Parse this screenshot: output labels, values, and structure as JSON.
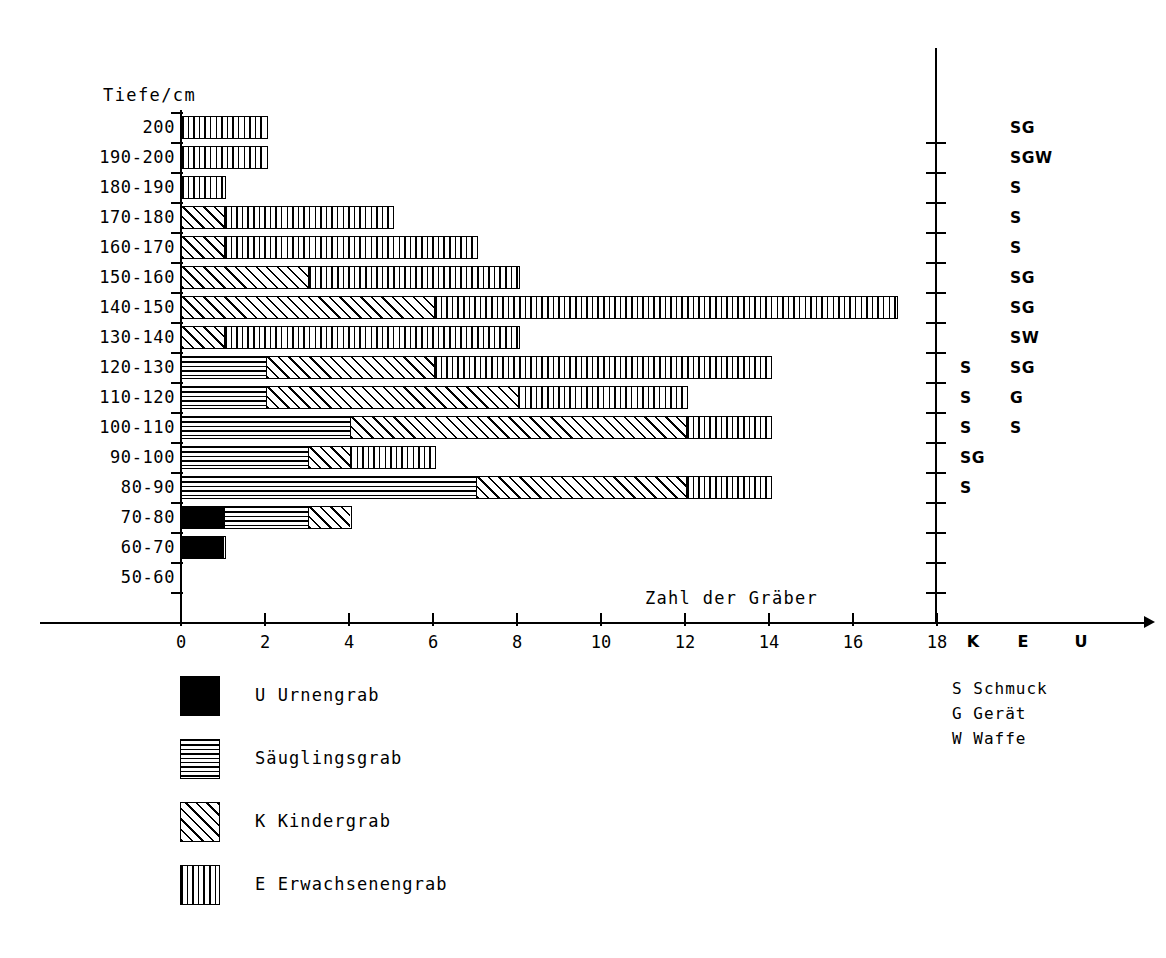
{
  "axes": {
    "y_title": "Tiefe/cm",
    "x_title": "Zahl der Gräber",
    "x_ticks": [
      "0",
      "2",
      "4",
      "6",
      "8",
      "10",
      "12",
      "14",
      "16",
      "18"
    ],
    "column_headers": [
      "K",
      "E",
      "U"
    ]
  },
  "goods_key": [
    "S Schmuck",
    "G Gerät",
    "W Waffe"
  ],
  "legend": [
    {
      "pattern": "solid-black",
      "pattern_name": "p-urne",
      "label": "U Urnengrab"
    },
    {
      "pattern": "horizontal-lines",
      "pattern_name": "p-saeugling",
      "label": "Säuglingsgrab"
    },
    {
      "pattern": "diagonal-hatch",
      "pattern_name": "p-kind",
      "label": "K Kindergrab"
    },
    {
      "pattern": "vertical-lines",
      "pattern_name": "p-erwachsen",
      "label": "E Erwachsenengrab"
    }
  ],
  "chart_data": {
    "type": "bar",
    "orientation": "horizontal",
    "stacked": true,
    "title": "",
    "xlabel": "Zahl der Gräber",
    "ylabel": "Tiefe/cm",
    "xlim": [
      0,
      18
    ],
    "xticks": [
      0,
      2,
      4,
      6,
      8,
      10,
      12,
      14,
      16,
      18
    ],
    "grid": false,
    "legend_position": "bottom-left",
    "categories": [
      "200",
      "190-200",
      "180-190",
      "170-180",
      "160-170",
      "150-160",
      "140-150",
      "130-140",
      "120-130",
      "110-120",
      "100-110",
      "90-100",
      "80-90",
      "70-80",
      "60-70",
      "50-60"
    ],
    "series": [
      {
        "name": "U Urnengrab",
        "key": "U",
        "values": [
          0,
          0,
          0,
          0,
          0,
          0,
          0,
          0,
          0,
          0,
          0,
          0,
          0,
          1,
          1,
          0
        ]
      },
      {
        "name": "Säuglingsgrab",
        "key": "S",
        "values": [
          0,
          0,
          0,
          0,
          0,
          0,
          0,
          0,
          2,
          2,
          4,
          3,
          7,
          2,
          0,
          0
        ]
      },
      {
        "name": "K Kindergrab",
        "key": "K",
        "values": [
          0,
          0,
          0,
          1,
          1,
          3,
          6,
          1,
          4,
          6,
          8,
          1,
          5,
          1,
          0,
          0
        ]
      },
      {
        "name": "E Erwachsenengrab",
        "key": "E",
        "values": [
          2,
          2,
          1,
          4,
          6,
          5,
          11,
          7,
          8,
          4,
          2,
          2,
          2,
          0,
          0,
          0
        ]
      }
    ],
    "totals": [
      2,
      2,
      1,
      5,
      7,
      8,
      17,
      8,
      14,
      12,
      14,
      6,
      14,
      4,
      1,
      0
    ],
    "grave_goods": [
      {
        "category": "200",
        "K": "",
        "E": "SG"
      },
      {
        "category": "190-200",
        "K": "",
        "E": "SGW"
      },
      {
        "category": "180-190",
        "K": "",
        "E": "S"
      },
      {
        "category": "170-180",
        "K": "",
        "E": "S"
      },
      {
        "category": "160-170",
        "K": "",
        "E": "S"
      },
      {
        "category": "150-160",
        "K": "",
        "E": "SG"
      },
      {
        "category": "140-150",
        "K": "",
        "E": "SG"
      },
      {
        "category": "130-140",
        "K": "",
        "E": "SW"
      },
      {
        "category": "120-130",
        "K": "S",
        "E": "SG"
      },
      {
        "category": "110-120",
        "K": "S",
        "E": "G"
      },
      {
        "category": "100-110",
        "K": "S",
        "E": "S"
      },
      {
        "category": "90-100",
        "K": "SG",
        "E": ""
      },
      {
        "category": "80-90",
        "K": "S",
        "E": ""
      },
      {
        "category": "70-80",
        "K": "",
        "E": ""
      },
      {
        "category": "60-70",
        "K": "",
        "E": ""
      },
      {
        "category": "50-60",
        "K": "",
        "E": ""
      }
    ],
    "goods_legend": {
      "S": "Schmuck",
      "G": "Gerät",
      "W": "Waffe"
    }
  },
  "colors": {
    "ink": "#000000",
    "paper": "#ffffff"
  }
}
